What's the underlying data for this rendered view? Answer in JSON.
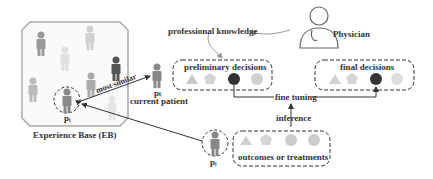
{
  "labels": {
    "experience_base": "Experience Base (EB)",
    "pi_eb": "pᵢ",
    "most_similar": "most similar",
    "pt": "pₜ",
    "current_patient": "current patient",
    "professional_knowledge": "professional knowledge",
    "physician": "Physician",
    "preliminary_decisions": "preliminary decisions",
    "final_decisions": "final decisions",
    "fine_tuning": "fine tuning",
    "inference": "inference",
    "outcomes_or_treatments": "outcomes or treatments",
    "pi_bottom": "pᵢ"
  },
  "colors": {
    "dark": "#333333",
    "mid_gray": "#8a8a8a",
    "light_gray": "#c8c8c8",
    "arrow_gray": "#9a9a9a"
  }
}
